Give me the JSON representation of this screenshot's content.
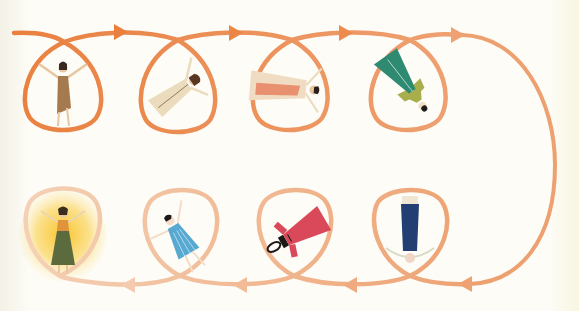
{
  "illustration": {
    "title": "Looping path of eight rotating figures",
    "background": "#fdfcf6",
    "path_colors": {
      "top_start": "#e9803f",
      "top_end": "#efa377",
      "right_arc": "#eda070",
      "bottom_start": "#eea67a",
      "bottom_end": "#f4cfb2"
    },
    "top_row": {
      "direction": "left-to-right",
      "arrows_x": [
        120,
        235,
        345,
        457
      ],
      "figures": [
        {
          "label": "Figure 1: standing upright, arms raised, brown dress",
          "cx": 63,
          "cy": 88,
          "rotation": 0,
          "dress": "#a57a4f",
          "skin": "#e9c6a0",
          "hair": "#3b2a20"
        },
        {
          "label": "Figure 2: tilted, cream robe, arms outstretched",
          "cx": 178,
          "cy": 90,
          "rotation": 55,
          "dress": "#eadcbd",
          "skin": "#e9c6a0",
          "hair": "#5a3720"
        },
        {
          "label": "Figure 3: horizontal, cream and salmon dress",
          "cx": 292,
          "cy": 88,
          "rotation": 95,
          "dress": "#f0dcc2",
          "accent": "#e8906f",
          "skin": "#e9c6a0",
          "hair": "#2a1e1a"
        },
        {
          "label": "Figure 4: diagonal upside-down, teal and olive dress",
          "cx": 410,
          "cy": 88,
          "rotation": 145,
          "dress": "#2e8a70",
          "accent": "#a9ae4c",
          "skin": "#f1dcc6",
          "hair": "#1e1a1a"
        }
      ]
    },
    "bottom_row": {
      "direction": "right-to-left",
      "arrows_x": [
        465,
        350,
        240,
        128
      ],
      "figures": [
        {
          "label": "Figure 5: upside-down, navy skirt",
          "cx": 410,
          "cy": 238,
          "rotation": 180,
          "dress": "#233e73",
          "skin": "#f1d6c6",
          "hair": "#efe6d3"
        },
        {
          "label": "Figure 6: tilted, red dress",
          "cx": 293,
          "cy": 236,
          "rotation": 240,
          "dress": "#d9495a",
          "skin": "#f1d6c6",
          "hair": "#1c1818"
        },
        {
          "label": "Figure 7: tilted, blue striped dress",
          "cx": 180,
          "cy": 238,
          "rotation": 330,
          "dress": "#58a9d1",
          "skin": "#f4dcc8",
          "hair": "#1c1818"
        },
        {
          "label": "Figure 8: standing upright, glowing, olive skirt",
          "cx": 63,
          "cy": 235,
          "rotation": 0,
          "dress": "#5b6b3d",
          "top": "#e0933a",
          "skin": "#e9c6a0",
          "hair": "#3a2c1e",
          "glow": "#f7c531"
        }
      ]
    }
  }
}
